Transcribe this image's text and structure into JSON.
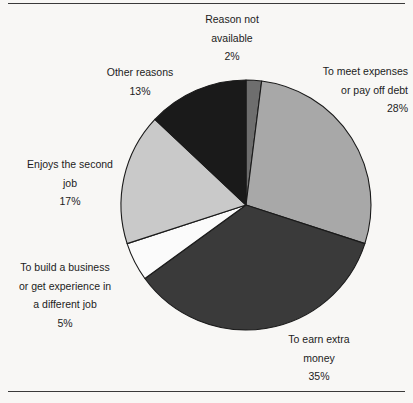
{
  "figure": {
    "background_color": "#f8f7f5",
    "rule_color": "#3a3a3a",
    "has_top_rule": true,
    "has_bottom_rule": true
  },
  "chart_data": {
    "type": "pie",
    "title": "",
    "subtitle": "",
    "xlabel": "",
    "ylabel": "",
    "legend_position": "none",
    "labels_position": "outside-callouts",
    "grid": false,
    "start_angle_deg": 0,
    "direction": "clockwise",
    "total": 100,
    "units": "%",
    "categories": [
      "Reason not available",
      "To meet expenses or pay off debt",
      "To earn extra money",
      "To build a business or get experience in a different job",
      "Enjoys the second job",
      "Other reasons"
    ],
    "values": [
      2,
      28,
      35,
      5,
      17,
      13
    ],
    "value_labels": [
      "2%",
      "28%",
      "35%",
      "5%",
      "17%",
      "13%"
    ],
    "colors": [
      "#6e6e6e",
      "#a8a8a8",
      "#3a3a3a",
      "#fbfbfb",
      "#c9c9c9",
      "#1a1a1a"
    ],
    "slice_border_color": "#1a1a1a",
    "slices": [
      {
        "name": "reason-not-available",
        "label_lines": [
          "Reason not",
          "available"
        ],
        "percent_label": "2%",
        "value": 2,
        "color": "#6e6e6e",
        "start_deg": 0,
        "end_deg": 7.2
      },
      {
        "name": "to-meet-expenses",
        "label_lines": [
          "To meet expenses",
          "or pay off debt"
        ],
        "percent_label": "28%",
        "value": 28,
        "color": "#a8a8a8",
        "start_deg": 7.2,
        "end_deg": 108.0
      },
      {
        "name": "to-earn-extra-money",
        "label_lines": [
          "To earn extra",
          "money"
        ],
        "percent_label": "35%",
        "value": 35,
        "color": "#3a3a3a",
        "start_deg": 108.0,
        "end_deg": 234.0
      },
      {
        "name": "to-build-a-business",
        "label_lines": [
          "To build a business",
          "or get experience in",
          "a different job"
        ],
        "percent_label": "5%",
        "value": 5,
        "color": "#fbfbfb",
        "start_deg": 234.0,
        "end_deg": 252.0
      },
      {
        "name": "enjoys-the-second-job",
        "label_lines": [
          "Enjoys the second",
          "job"
        ],
        "percent_label": "17%",
        "value": 17,
        "color": "#c9c9c9",
        "start_deg": 252.0,
        "end_deg": 313.2
      },
      {
        "name": "other-reasons",
        "label_lines": [
          "Other reasons"
        ],
        "percent_label": "13%",
        "value": 13,
        "color": "#1a1a1a",
        "start_deg": 313.2,
        "end_deg": 360.0
      }
    ],
    "geometry": {
      "center_x": 246,
      "center_y": 205,
      "radius": 125
    }
  },
  "labels": {
    "reason_not_available": {
      "line1": "Reason not",
      "line2": "available",
      "percent": "2%"
    },
    "meet_expenses": {
      "line1": "To meet expenses",
      "line2": "or pay off debt",
      "percent": "28%"
    },
    "other_reasons": {
      "line1": "Other reasons",
      "percent": "13%"
    },
    "enjoys_second_job": {
      "line1": "Enjoys the second",
      "line2": "job",
      "percent": "17%"
    },
    "build_business": {
      "line1": "To build a business",
      "line2": "or get experience in",
      "line3": "a different job",
      "percent": "5%"
    },
    "earn_extra_money": {
      "line1": "To earn extra",
      "line2": "money",
      "percent": "35%"
    }
  }
}
